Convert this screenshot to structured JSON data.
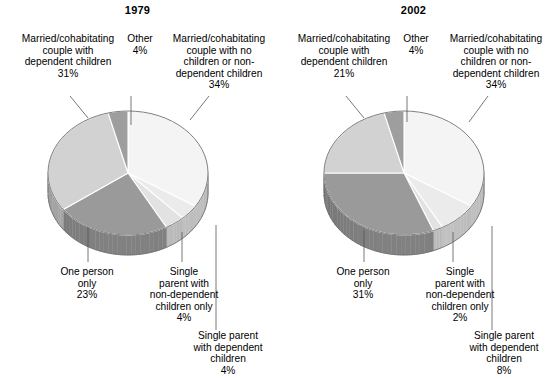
{
  "chart_data": [
    {
      "type": "pie",
      "title": "1979",
      "three_d": true,
      "categories": [
        "Married/cohabitating couple with no children or non-dependent children",
        "Single parent with dependent children",
        "Single parent with non-dependent children only",
        "One person only",
        "Married/cohabitating couple with dependent children",
        "Other"
      ],
      "values": [
        34,
        4,
        4,
        23,
        31,
        4
      ],
      "value_labels": [
        "34%",
        "4%",
        "4%",
        "23%",
        "31%",
        "4%"
      ],
      "colors": [
        "#f4f4f4",
        "#ebebeb",
        "#e2e2e2",
        "#9a9a9a",
        "#d2d2d2",
        "#9e9e9e"
      ],
      "legend": "none",
      "grid": false
    },
    {
      "type": "pie",
      "title": "2002",
      "three_d": true,
      "categories": [
        "Married/cohabitating couple with no children or non-dependent children",
        "Single parent with dependent children",
        "Single parent with non-dependent children only",
        "One person only",
        "Married/cohabitating couple with dependent children",
        "Other"
      ],
      "values": [
        34,
        8,
        2,
        31,
        21,
        4
      ],
      "value_labels": [
        "34%",
        "8%",
        "2%",
        "31%",
        "21%",
        "4%"
      ],
      "colors": [
        "#f4f4f4",
        "#ebebeb",
        "#e2e2e2",
        "#9a9a9a",
        "#d2d2d2",
        "#9e9e9e"
      ],
      "legend": "none",
      "grid": false
    }
  ],
  "left_chart": {
    "title": "1979",
    "labels": {
      "married_dependent": "Married/cohabitating\ncouple with\ndependent children\n31%",
      "other": "Other\n4%",
      "married_no_children": "Married/cohabitating\ncouple with no\nchildren or non-\ndependent children\n34%",
      "one_person": "One person\nonly\n23%",
      "single_non_dependent": "Single\nparent with\nnon-dependent\nchildren only\n4%",
      "single_dependent": "Single parent\nwith dependent\nchildren\n4%"
    }
  },
  "right_chart": {
    "title": "2002",
    "labels": {
      "married_dependent": "Married/cohabitating\ncouple with\ndependent children\n21%",
      "other": "Other\n4%",
      "married_no_children": "Married/cohabitating\ncouple with no\nchildren or non-\ndependent children\n34%",
      "one_person": "One person\nonly\n31%",
      "single_non_dependent": "Single\nparent with\nnon-dependent\nchildren only\n2%",
      "single_dependent": "Single parent\nwith dependent\nchildren\n8%"
    }
  }
}
